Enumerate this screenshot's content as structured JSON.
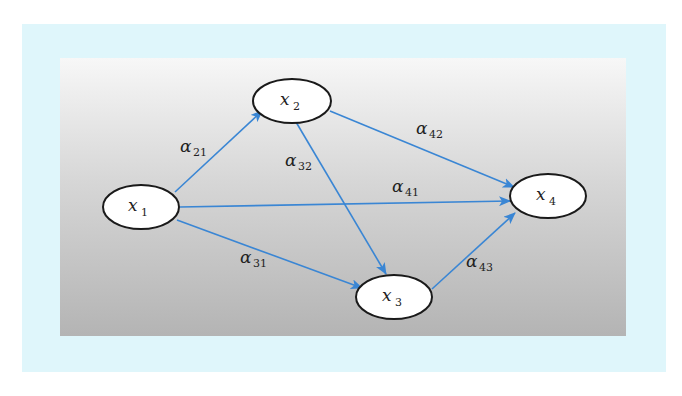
{
  "colors": {
    "frame": "#dff6fb",
    "panel_top": "#f7f7f7",
    "panel_bottom": "#b4b4b4",
    "edge": "#3a86d4",
    "node_fill": "#ffffff",
    "node_stroke": "#1a1a1a"
  },
  "nodes": [
    {
      "id": "x1",
      "var": "x",
      "sub": "1"
    },
    {
      "id": "x2",
      "var": "x",
      "sub": "2"
    },
    {
      "id": "x3",
      "var": "x",
      "sub": "3"
    },
    {
      "id": "x4",
      "var": "x",
      "sub": "4"
    }
  ],
  "edges": [
    {
      "from": "x1",
      "to": "x2",
      "symbol": "α",
      "sub": "21"
    },
    {
      "from": "x2",
      "to": "x3",
      "symbol": "α",
      "sub": "32"
    },
    {
      "from": "x2",
      "to": "x4",
      "symbol": "α",
      "sub": "42"
    },
    {
      "from": "x1",
      "to": "x4",
      "symbol": "α",
      "sub": "41"
    },
    {
      "from": "x1",
      "to": "x3",
      "symbol": "α",
      "sub": "31"
    },
    {
      "from": "x3",
      "to": "x4",
      "symbol": "α",
      "sub": "43"
    }
  ]
}
